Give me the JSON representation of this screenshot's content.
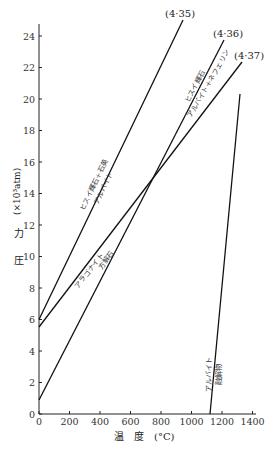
{
  "chart_data": {
    "type": "line",
    "title": "",
    "xlabel": "温　度 (°C)",
    "ylabel": "圧　力 (×10³atm)",
    "xlim": [
      0,
      1400
    ],
    "ylim": [
      0,
      25
    ],
    "xticks": [
      0,
      200,
      400,
      600,
      800,
      1000,
      1200,
      1400
    ],
    "yticks": [
      0,
      2,
      4,
      6,
      8,
      10,
      12,
      14,
      16,
      18,
      20,
      22,
      24
    ],
    "grid": false,
    "series": [
      {
        "name": "(4·35)",
        "upper_label": "ヒスイ輝石＋石英",
        "lower_label": "アルバイト",
        "x": [
          0,
          944
        ],
        "y": [
          6.0,
          25.0
        ]
      },
      {
        "name": "(4·36)",
        "upper_label": "ヒスイ輝石",
        "lower_label": "アルバイト＋ネフェリン",
        "x": [
          0,
          1213
        ],
        "y": [
          0.9,
          23.7
        ]
      },
      {
        "name": "(4·37)",
        "upper_label": "アラゴナイト",
        "lower_label": "方解石",
        "x": [
          0,
          1331
        ],
        "y": [
          5.5,
          22.4
        ]
      },
      {
        "name": "albite-melting",
        "upper_label": "アルバイト",
        "lower_label": "融解物",
        "x": [
          1120,
          1318
        ],
        "y": [
          0,
          20.3
        ]
      }
    ]
  },
  "axis": {
    "x_title": "温　度　(°C)",
    "y_title_1": "圧",
    "y_title_2": "力",
    "y_title_3": "(×10³atm)"
  },
  "labels": {
    "eq35": "(4·35)",
    "eq36": "(4·36)",
    "eq37": "(4·37)",
    "l35_upper": "ヒスイ輝石＋石英",
    "l35_lower": "アルバイト",
    "l36_upper": "ヒスイ輝石",
    "l36_lower": "アルバイト＋ネフェリン",
    "l37_upper": "アラゴナイト",
    "l37_lower": "方解石",
    "melt_upper": "アルバイト",
    "melt_lower": "融解物"
  }
}
